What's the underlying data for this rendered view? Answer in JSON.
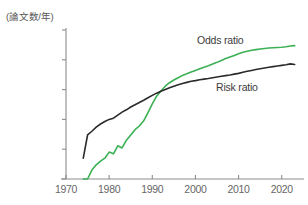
{
  "chart_data": {
    "type": "line",
    "title": "",
    "ylabel": "(論文数/年)",
    "xlabel": "",
    "y_scale": "log",
    "ylim": [
      1,
      100000
    ],
    "xlim": [
      1970,
      2024
    ],
    "grid": false,
    "legend_position": "inline-annotation",
    "y_ticks": [
      {
        "value": 100000,
        "label": "100,000"
      },
      {
        "value": 10000,
        "label": "10,000"
      },
      {
        "value": 1000,
        "label": "1,000"
      },
      {
        "value": 100,
        "label": "100"
      },
      {
        "value": 10,
        "label": "10"
      },
      {
        "value": 1,
        "label": "1"
      }
    ],
    "x_ticks": [
      {
        "value": 1970,
        "label": "1970"
      },
      {
        "value": 1980,
        "label": "1980"
      },
      {
        "value": 1990,
        "label": "1990"
      },
      {
        "value": 2000,
        "label": "2000"
      },
      {
        "value": 2010,
        "label": "2010"
      },
      {
        "value": 2020,
        "label": "2020"
      }
    ],
    "series": [
      {
        "name": "Odds ratio",
        "color": "#3cb054",
        "label_text": "Odds ratio",
        "x": [
          1974,
          1975,
          1976,
          1977,
          1978,
          1979,
          1980,
          1981,
          1982,
          1983,
          1984,
          1985,
          1986,
          1987,
          1988,
          1989,
          1990,
          1991,
          1992,
          1993,
          1994,
          1995,
          1996,
          1997,
          1998,
          1999,
          2000,
          2001,
          2002,
          2003,
          2004,
          2005,
          2006,
          2007,
          2008,
          2009,
          2010,
          2011,
          2012,
          2013,
          2014,
          2015,
          2016,
          2017,
          2018,
          2019,
          2020,
          2021,
          2022,
          2023
        ],
        "values": [
          1,
          1,
          2,
          3,
          4,
          5,
          8,
          7,
          13,
          11,
          20,
          30,
          45,
          60,
          90,
          170,
          330,
          600,
          900,
          1300,
          1700,
          2100,
          2500,
          3000,
          3400,
          3900,
          4400,
          5000,
          5600,
          6300,
          7200,
          8200,
          9500,
          11000,
          12500,
          14000,
          16000,
          18000,
          19500,
          21000,
          22000,
          23000,
          24000,
          25000,
          25500,
          26000,
          26500,
          27500,
          29000,
          30000
        ]
      },
      {
        "name": "Risk ratio",
        "color": "#2b2b2b",
        "label_text": "Risk ratio",
        "x": [
          1974,
          1975,
          1976,
          1977,
          1978,
          1979,
          1980,
          1981,
          1982,
          1983,
          1984,
          1985,
          1986,
          1987,
          1988,
          1989,
          1990,
          1991,
          1992,
          1993,
          1994,
          1995,
          1996,
          1997,
          1998,
          1999,
          2000,
          2001,
          2002,
          2003,
          2004,
          2005,
          2006,
          2007,
          2008,
          2009,
          2010,
          2011,
          2012,
          2013,
          2014,
          2015,
          2016,
          2017,
          2018,
          2019,
          2020,
          2021,
          2022,
          2023
        ],
        "values": [
          5,
          30,
          40,
          55,
          70,
          85,
          100,
          110,
          140,
          175,
          210,
          260,
          310,
          370,
          440,
          530,
          640,
          760,
          880,
          1000,
          1150,
          1300,
          1450,
          1600,
          1750,
          1900,
          2000,
          2150,
          2250,
          2350,
          2500,
          2650,
          2800,
          2950,
          3100,
          3300,
          3500,
          3800,
          4100,
          4400,
          4700,
          5000,
          5300,
          5600,
          5900,
          6200,
          6500,
          6800,
          7300,
          7000
        ]
      }
    ],
    "annotations": [
      {
        "text": "Odds ratio",
        "x_px": 197,
        "y_px": 34
      },
      {
        "text": "Risk ratio",
        "x_px": 216,
        "y_px": 81
      }
    ]
  },
  "colors": {
    "odds_ratio": "#3cb054",
    "risk_ratio": "#2b2b2b",
    "axis": "#8c8c8c",
    "tick_text": "#666666",
    "background": "#ffffff"
  }
}
